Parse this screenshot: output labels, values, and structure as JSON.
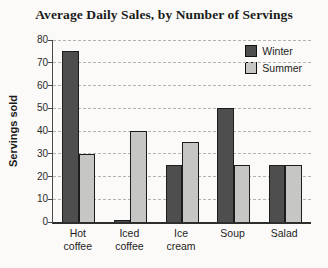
{
  "chart_data": {
    "type": "bar",
    "title": "Average Daily Sales, by Number of Servings",
    "xlabel": "",
    "ylabel": "Servings sold",
    "categories": [
      "Hot\ncoffee",
      "Iced\ncoffee",
      "Ice\ncream",
      "Soup",
      "Salad"
    ],
    "series": [
      {
        "name": "Winter",
        "color": "#4e4e4e",
        "values": [
          75,
          1,
          25,
          50,
          25
        ]
      },
      {
        "name": "Summer",
        "color": "#c6c6c5",
        "values": [
          30,
          40,
          35,
          25,
          25
        ]
      }
    ],
    "ylim": [
      0,
      80
    ],
    "yticks": [
      0,
      10,
      20,
      30,
      40,
      50,
      60,
      70,
      80
    ],
    "grid": "horizontal-dashed",
    "gridline_color": "#b3b3b1",
    "legend_position": "top-right",
    "bar_border_color": "#1c1c1c"
  }
}
